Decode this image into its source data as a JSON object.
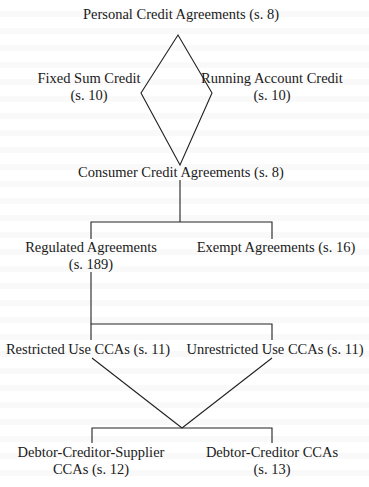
{
  "diagram": {
    "type": "classification-tree",
    "nodes": {
      "personal_credit": {
        "label": "Personal Credit Agreements (s. 8)"
      },
      "fixed_sum": {
        "line1": "Fixed Sum Credit",
        "line2": "(s. 10)"
      },
      "running_account": {
        "line1": "Running Account Credit",
        "line2": "(s. 10)"
      },
      "consumer_credit": {
        "label": "Consumer Credit Agreements (s. 8)"
      },
      "regulated": {
        "line1": "Regulated Agreements",
        "line2": "(s. 189)"
      },
      "exempt": {
        "label": "Exempt Agreements (s. 16)"
      },
      "restricted_use": {
        "label": "Restricted Use CCAs (s. 11)"
      },
      "unrestricted_use": {
        "label": "Unrestricted Use CCAs (s. 11)"
      },
      "dcs": {
        "line1": "Debtor-Creditor-Supplier",
        "line2": "CCAs (s. 12)"
      },
      "dc": {
        "line1": "Debtor-Creditor CCAs",
        "line2": "(s. 13)"
      }
    },
    "edges": [
      [
        "personal_credit",
        "fixed_sum"
      ],
      [
        "personal_credit",
        "running_account"
      ],
      [
        "fixed_sum",
        "consumer_credit"
      ],
      [
        "running_account",
        "consumer_credit"
      ],
      [
        "consumer_credit",
        "regulated"
      ],
      [
        "consumer_credit",
        "exempt"
      ],
      [
        "regulated",
        "restricted_use"
      ],
      [
        "regulated",
        "unrestricted_use"
      ],
      [
        "restricted_use",
        "dcs"
      ],
      [
        "restricted_use",
        "dc"
      ],
      [
        "unrestricted_use",
        "dcs"
      ],
      [
        "unrestricted_use",
        "dc"
      ]
    ]
  }
}
